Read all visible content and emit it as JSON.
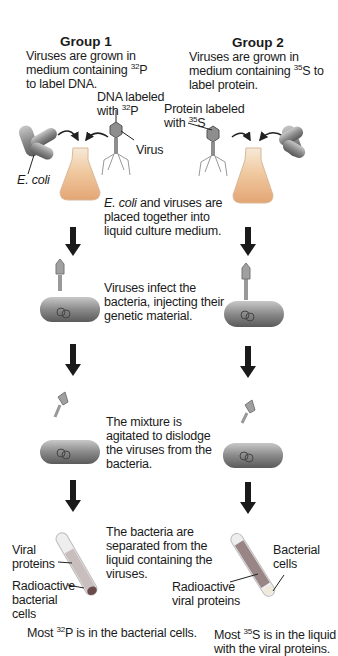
{
  "group1": {
    "title": "Group 1",
    "intro": [
      "Viruses are grown in",
      "medium containing ",
      "32",
      "P",
      "to label DNA."
    ],
    "dna_label": [
      "DNA labeled",
      "with ",
      "32",
      "P"
    ],
    "virus_label": "Virus",
    "ecoli_label": "E. coli",
    "tube_labels": {
      "top": [
        "Viral",
        "proteins"
      ],
      "bottom": [
        "Radioactive",
        "bacterial",
        "cells"
      ]
    },
    "result": [
      "Most ",
      "32",
      "P is in the bacterial cells."
    ]
  },
  "group2": {
    "title": "Group 2",
    "intro": [
      "Viruses are grown in",
      "medium containing ",
      "35",
      "S to",
      "label protein."
    ],
    "protein_label": [
      "Protein labeled",
      "with ",
      "35",
      "S"
    ],
    "tube_labels": {
      "top": [
        "Bacterial",
        "cells"
      ],
      "bottom": [
        "Radioactive",
        "viral proteins"
      ]
    },
    "result": [
      "Most ",
      "35",
      "S is in the liquid",
      "with the viral proteins."
    ]
  },
  "steps": [
    {
      "lines": [
        "E. coli",
        " and viruses are",
        "placed together into",
        "liquid culture medium."
      ]
    },
    {
      "lines": [
        "Viruses infect the",
        "bacteria, injecting their",
        "genetic material."
      ]
    },
    {
      "lines": [
        "The mixture is",
        "agitated to dislodge",
        "the viruses from the",
        "bacteria."
      ]
    },
    {
      "lines": [
        "The bacteria are",
        "separated from the",
        "liquid containing the",
        "viruses."
      ]
    }
  ],
  "colors": {
    "arrow": "#1a1a1a",
    "bacterium": "#8c8c8c",
    "flask": "#e8b58a",
    "virus": "#9a9a9a"
  }
}
